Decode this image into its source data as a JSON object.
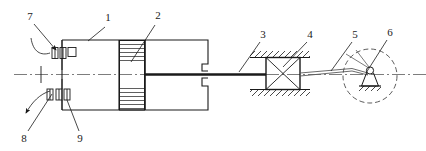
{
  "figure": {
    "type": "mechanical-assembly-schematic",
    "width": 426,
    "height": 151,
    "background_color": "#ffffff",
    "line_color": "#1a1a1a",
    "centerline_style": "dash-dot"
  },
  "callouts": [
    {
      "id": "1",
      "label": "1",
      "x": 108,
      "y": 21,
      "target_x": 88,
      "target_y": 42,
      "points_to": "housing-body-outline"
    },
    {
      "id": "2",
      "label": "2",
      "x": 158,
      "y": 19,
      "target_x": 130,
      "target_y": 62,
      "points_to": "hatched-hub"
    },
    {
      "id": "3",
      "label": "3",
      "x": 263,
      "y": 36,
      "target_x": 240,
      "target_y": 72,
      "points_to": "connecting-shaft"
    },
    {
      "id": "4",
      "label": "4",
      "x": 310,
      "y": 36,
      "target_x": 283,
      "target_y": 68,
      "points_to": "cross-guide-block"
    },
    {
      "id": "5",
      "label": "5",
      "x": 355,
      "y": 36,
      "target_x": 330,
      "target_y": 70,
      "points_to": "detail-circle"
    },
    {
      "id": "6",
      "label": "6",
      "x": 390,
      "y": 34,
      "target_x": 368,
      "target_y": 76,
      "points_to": "pivot-support"
    },
    {
      "id": "7",
      "label": "7",
      "x": 30,
      "y": 17,
      "target_x": 57,
      "target_y": 52,
      "points_to": "upper-bearing-group"
    },
    {
      "id": "8",
      "label": "8",
      "x": 24,
      "y": 138,
      "target_x": 50,
      "target_y": 97,
      "points_to": "lower-bearing-group"
    },
    {
      "id": "9",
      "label": "9",
      "x": 78,
      "y": 138,
      "target_x": 68,
      "target_y": 100,
      "points_to": "seal-element"
    }
  ],
  "parts": {
    "housing_body": {
      "name": "housing-body-outline",
      "x": 62,
      "y": 40,
      "width": 146,
      "height": 70
    },
    "hatched_hub": {
      "name": "hatched-hub",
      "x": 119,
      "y": 40,
      "width": 26,
      "height": 70,
      "hatch": "horizontal"
    },
    "upper_bearings": {
      "name": "upper-bearing-group",
      "count": 3,
      "y": 50
    },
    "lower_bearings": {
      "name": "lower-bearing-group",
      "count": 3,
      "y": 92
    },
    "shaft": {
      "name": "connecting-shaft",
      "from_x": 145,
      "to_x": 266,
      "y": 74
    },
    "guide_block": {
      "name": "cross-guide-block",
      "x": 266,
      "y": 57,
      "width": 34,
      "height": 32,
      "bracing": "x-cross"
    },
    "ground_hatch_top": {
      "name": "ground-hatching-top",
      "y": 57
    },
    "ground_hatch_bottom": {
      "name": "ground-hatching-bottom",
      "y": 89
    },
    "detail_circle": {
      "name": "detail-circle",
      "cx": 370,
      "cy": 76,
      "r": 27,
      "style": "dashed"
    },
    "pivot_support": {
      "name": "pivot-support",
      "cx": 370,
      "cy": 74
    }
  }
}
